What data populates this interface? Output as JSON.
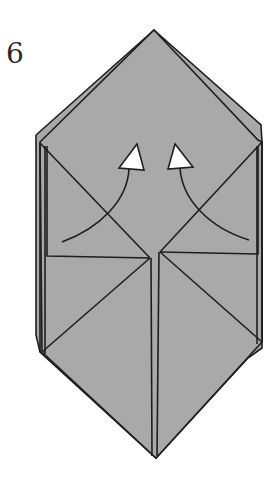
{
  "diagram": {
    "step_number": "6",
    "colors": {
      "paper": "#a9a9a9",
      "line": "#1e1e1e",
      "arrow_fill": "#ffffff",
      "background": "#ffffff"
    },
    "arrows": [
      {
        "name": "left-flap-up-arrow",
        "direction": "up"
      },
      {
        "name": "right-flap-up-arrow",
        "direction": "up"
      }
    ]
  }
}
